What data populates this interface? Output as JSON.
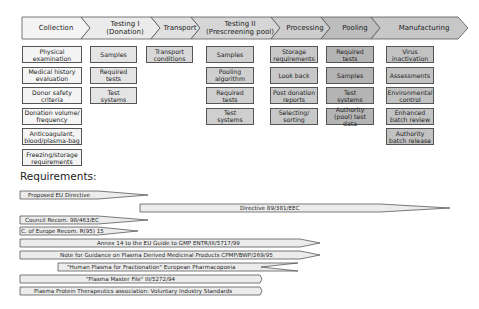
{
  "header": {
    "stages": [
      {
        "id": "collection",
        "label": "Collection",
        "x1": 22,
        "x2": 90,
        "fill": "#f4f4f4"
      },
      {
        "id": "testing-1",
        "label": "Testing I\n(Donation)",
        "x1": 90,
        "x2": 160,
        "fill": "#ebebeb"
      },
      {
        "id": "transport",
        "label": "Transport",
        "x1": 160,
        "x2": 200,
        "fill": "#e0e0e0"
      },
      {
        "id": "testing-2",
        "label": "Testing II\n(Prescreening pool)",
        "x1": 200,
        "x2": 280,
        "fill": "#d6d6d6"
      },
      {
        "id": "processing",
        "label": "Processing",
        "x1": 280,
        "x2": 330,
        "fill": "#cdcdcd"
      },
      {
        "id": "pooling",
        "label": "Pooling",
        "x1": 330,
        "x2": 380,
        "fill": "#bdbdbd"
      },
      {
        "id": "manufacturing",
        "label": "Manufacturing",
        "x1": 380,
        "x2": 468,
        "fill": "#c7c7c7"
      }
    ]
  },
  "columns": [
    {
      "id": "collection",
      "x": 22,
      "w": 60,
      "cls": "c0",
      "items": [
        "Physical\nexamination",
        "Medical history\nevaluation",
        "Donor safety\ncriteria",
        "Donation volume/\nfrequency",
        "Anticoagulant,\nblood/plasma-bag",
        "Freezing/storage\nrequirements"
      ]
    },
    {
      "id": "testing-1",
      "x": 90,
      "w": 47,
      "cls": "c1",
      "items": [
        "Samples",
        "Required\ntests",
        "Test\nsystems"
      ]
    },
    {
      "id": "transport",
      "x": 146,
      "w": 47,
      "cls": "c2",
      "items": [
        "Transport\nconditions"
      ]
    },
    {
      "id": "testing-2",
      "x": 206,
      "w": 48,
      "cls": "c3",
      "items": [
        "Samples",
        "Pooling\nalgorithm",
        "Required\ntests",
        "Test\nsystems"
      ]
    },
    {
      "id": "processing",
      "x": 270,
      "w": 48,
      "cls": "c4",
      "items": [
        "Storage\nrequirements",
        "Look back",
        "Post donation\nreports",
        "Selecting/\nsorting"
      ]
    },
    {
      "id": "pooling",
      "x": 326,
      "w": 48,
      "cls": "c5",
      "items": [
        "Required\ntests",
        "Samples",
        "Test\nsystems",
        "Authority\n(pool) test data"
      ]
    },
    {
      "id": "manufacturing",
      "x": 386,
      "w": 48,
      "cls": "c6",
      "items": [
        "Virus\ninactivation",
        "Assessments",
        "Environmental\ncontrol",
        "Enhanced\nbatch review",
        "Authority\nbatch release"
      ]
    }
  ],
  "requirements": {
    "title": "Requirements:",
    "bars": [
      {
        "label": "Proposed EU Directive",
        "x": 20,
        "y": 191,
        "body_w": 78,
        "tip_x": 128,
        "text_x": 8
      },
      {
        "label": "Directive 89/381/EEC",
        "x": 140,
        "y": 204,
        "body_w": 240,
        "tip_x": 310,
        "text_x": 100
      },
      {
        "label": "Council Recom. 98/463/EC",
        "x": 20,
        "y": 216,
        "body_w": 78,
        "tip_x": 128,
        "text_x": 5
      },
      {
        "label": "C. of Europe Recom. R(95) 15",
        "x": 20,
        "y": 227,
        "body_w": 78,
        "tip_x": 118,
        "text_x": 1
      },
      {
        "label": "Annex 14 to the EU Guide to GMP ENTR/III/5717/99",
        "x": 20,
        "y": 239,
        "body_w": 280,
        "tip_x": 300,
        "text_x": 77
      },
      {
        "label": "Note for Guidance on Plasma Derived Medicinal Products CPMP/BWP/269/95",
        "x": 20,
        "y": 251,
        "body_w": 280,
        "tip_x": 300,
        "text_x": 40
      },
      {
        "label": "\"Human Plasma for Fractionation\" European Pharmacopoeia",
        "x": 58,
        "y": 263,
        "body_w": 240,
        "tip_x": 203,
        "text_x": 9
      },
      {
        "label": "\"Plasma Master File\" III/5272/94",
        "x": 20,
        "y": 275,
        "body_w": 240,
        "tip_x": 242,
        "text_x": 66
      },
      {
        "label": "Plasma Protein Therapeutics association: Voluntary Industry Standards",
        "x": 20,
        "y": 287,
        "body_w": 240,
        "tip_x": 242,
        "text_x": 14
      }
    ]
  }
}
